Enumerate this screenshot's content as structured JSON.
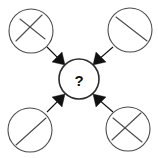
{
  "diagram": {
    "type": "analogy-puzzle",
    "background_color": "#ffffff",
    "line_color": "#4a4a4a",
    "arrow_color": "#111111",
    "center": {
      "label": "?",
      "name": "unknown-answer",
      "cx": 79,
      "cy": 79,
      "r": 20
    },
    "nodes": [
      {
        "id": "top-left",
        "position": "top-left",
        "cx": 31,
        "cy": 31,
        "r": 22,
        "pattern": "cross-chords",
        "chords": [
          {
            "x1": 16,
            "y1": 41,
            "x2": 42,
            "y2": 15
          },
          {
            "x1": 20,
            "y1": 19,
            "x2": 45,
            "y2": 39
          }
        ]
      },
      {
        "id": "top-right",
        "position": "top-right",
        "cx": 130,
        "cy": 30,
        "r": 22,
        "pattern": "single-diagonal-backslash",
        "chords": [
          {
            "x1": 116,
            "y1": 17,
            "x2": 147,
            "y2": 41
          }
        ]
      },
      {
        "id": "bottom-left",
        "position": "bottom-left",
        "cx": 30,
        "cy": 130,
        "r": 22,
        "pattern": "single-diagonal-slash",
        "chords": [
          {
            "x1": 16,
            "y1": 145,
            "x2": 46,
            "y2": 118
          }
        ]
      },
      {
        "id": "bottom-right",
        "position": "bottom-right",
        "cx": 128,
        "cy": 129,
        "r": 22,
        "pattern": "cross-chords",
        "chords": [
          {
            "x1": 112,
            "y1": 140,
            "x2": 141,
            "y2": 113
          },
          {
            "x1": 113,
            "y1": 118,
            "x2": 142,
            "y2": 142
          }
        ]
      }
    ],
    "arrows": [
      {
        "id": "arrow-from-top-left",
        "from": "top-left",
        "to": "center",
        "direction": "down-right",
        "shaft": {
          "x1": 48,
          "y1": 48,
          "x2": 62,
          "y2": 62
        },
        "head_tip": {
          "x": 65,
          "y": 65
        }
      },
      {
        "id": "arrow-from-top-right",
        "from": "top-right",
        "to": "center",
        "direction": "down-left",
        "shaft": {
          "x1": 112,
          "y1": 48,
          "x2": 96,
          "y2": 62
        },
        "head_tip": {
          "x": 93,
          "y": 65
        }
      },
      {
        "id": "arrow-from-bottom-left",
        "from": "bottom-left",
        "to": "center",
        "direction": "up-right",
        "shaft": {
          "x1": 48,
          "y1": 112,
          "x2": 62,
          "y2": 97
        },
        "head_tip": {
          "x": 65,
          "y": 94
        }
      },
      {
        "id": "arrow-from-bottom-right",
        "from": "bottom-right",
        "to": "center",
        "direction": "up-left",
        "shaft": {
          "x1": 112,
          "y1": 112,
          "x2": 96,
          "y2": 97
        },
        "head_tip": {
          "x": 93,
          "y": 94
        }
      }
    ]
  }
}
